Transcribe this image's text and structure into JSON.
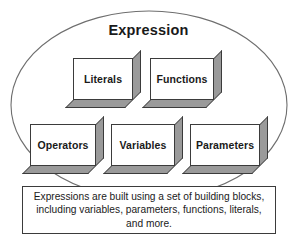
{
  "figure": {
    "title": "Expression",
    "ellipse_label": "Expression",
    "blocks": [
      {
        "id": "literals",
        "label": "Literals"
      },
      {
        "id": "functions",
        "label": "Functions"
      },
      {
        "id": "operators",
        "label": "Operators"
      },
      {
        "id": "variables",
        "label": "Variables"
      },
      {
        "id": "parameters",
        "label": "Parameters"
      }
    ],
    "caption": "Expressions are built using a set of building blocks, including variables, parameters, functions, literals, and more.",
    "colors": {
      "outline": "#3b3b3b",
      "block_face": "#ffffff",
      "block_shadow": "#9a9a9a",
      "text": "#1a1a1a",
      "background": "#ffffff"
    }
  }
}
